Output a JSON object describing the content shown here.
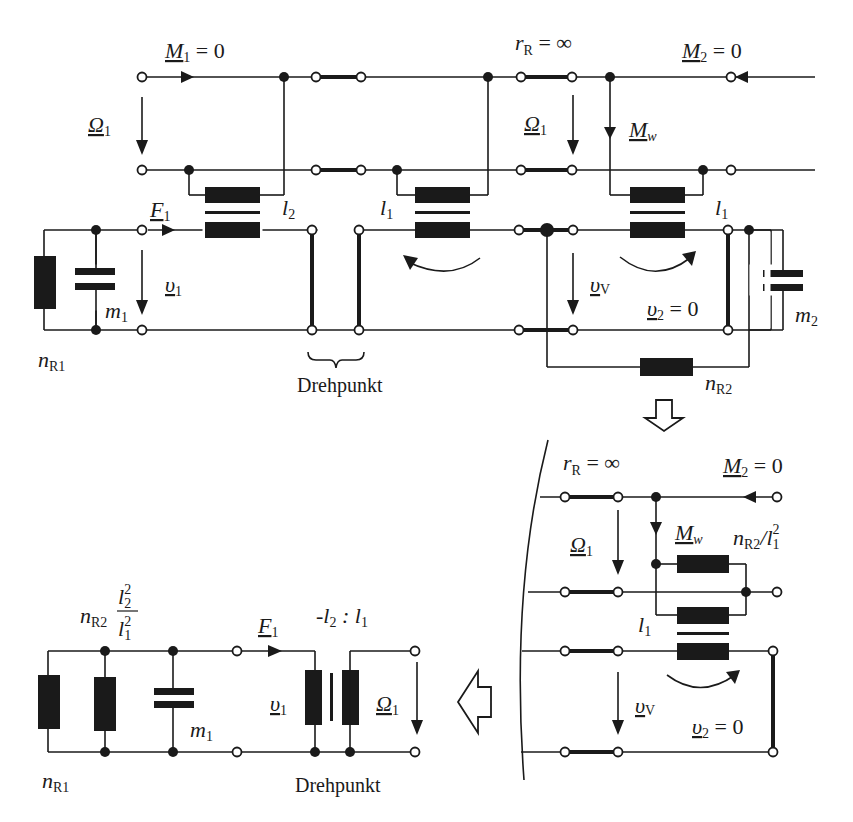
{
  "header": {
    "left_text": "",
    "right_text": ""
  },
  "top_circuit": {
    "labels": {
      "M1": "M",
      "M1_sub": "1",
      "M1_eq": " = 0",
      "rR": "r",
      "rR_sub": "R",
      "rR_eq": " = ∞",
      "M2": "M",
      "M2_sub": "2",
      "M2_eq": " = 0",
      "Omega1_left": "Ω",
      "Omega1_left_sub": "1",
      "Omega1_mid": "Ω",
      "Omega1_mid_sub": "1",
      "Mw": "M",
      "Mw_sub": "w",
      "F1": "F",
      "F1_sub": "1",
      "l2": "l",
      "l2_sub": "2",
      "l1_left": "l",
      "l1_left_sub": "1",
      "l1_right": "l",
      "l1_right_sub": "1",
      "v1": "υ",
      "v1_sub": "1",
      "vV": "υ",
      "vV_sub": "V",
      "v2": "υ",
      "v2_sub": "2",
      "v2_eq": " = 0",
      "m1": "m",
      "m1_sub": "1",
      "m2": "m",
      "m2_sub": "2",
      "nR1": "n",
      "nR1_sub": "R1",
      "nR2": "n",
      "nR2_sub": "R2",
      "pivot": "Drehpunkt"
    }
  },
  "right_circuit": {
    "labels": {
      "rR": "r",
      "rR_sub": "R",
      "rR_eq": " = ∞",
      "M2": "M",
      "M2_sub": "2",
      "M2_eq": " = 0",
      "Omega1": "Ω",
      "Omega1_sub": "1",
      "Mw": "M",
      "Mw_sub": "w",
      "nR2_over": "n",
      "nR2_over_sub": "R2",
      "nR2_over_slash": "/l",
      "nR2_over_l_sub": "1",
      "nR2_over_sup": "2",
      "l1": "l",
      "l1_sub": "1",
      "vV": "υ",
      "vV_sub": "V",
      "v2": "υ",
      "v2_sub": "2",
      "v2_eq": " = 0"
    }
  },
  "bottom_left_circuit": {
    "labels": {
      "nR2": "n",
      "nR2_sub": "R2",
      "frac_num": "l",
      "frac_num_sub": "2",
      "frac_num_sup": "2",
      "frac_den": "l",
      "frac_den_sub": "1",
      "frac_den_sup": "2",
      "F1": "F",
      "F1_sub": "1",
      "ratio": "-l",
      "ratio_sub1": "2",
      "ratio_colon": " : l",
      "ratio_sub2": "1",
      "v1": "υ",
      "v1_sub": "1",
      "Omega1": "Ω",
      "Omega1_sub": "1",
      "m1": "m",
      "m1_sub": "1",
      "nR1": "n",
      "nR1_sub": "R1",
      "pivot": "Drehpunkt"
    }
  },
  "arrows": {
    "down_arrow": "transform-down",
    "left_arrow": "transform-left"
  }
}
